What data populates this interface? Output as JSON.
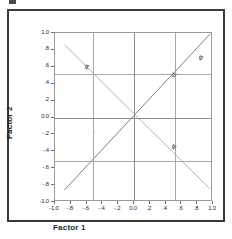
{
  "figure": {
    "x_axis_title": "Factor 1",
    "y_axis_title": "Factor 2"
  },
  "chart_data": {
    "type": "scatter",
    "title": "",
    "subtitle": "",
    "xlabel": "Factor 1",
    "ylabel": "Factor 2",
    "xlim": [
      -1.0,
      1.0
    ],
    "ylim": [
      -1.0,
      1.0
    ],
    "grid": true,
    "legend": "none",
    "xticks": [
      "-1.0",
      "-.8",
      "-.6",
      "-.4",
      "-.2",
      "0.0",
      ".2",
      ".4",
      ".6",
      ".8",
      "1.0"
    ],
    "xtick_values": [
      -1.0,
      -0.8,
      -0.6,
      -0.4,
      -0.2,
      0.0,
      0.2,
      0.4,
      0.6,
      0.8,
      1.0
    ],
    "yticks": [
      "1.0",
      ".8",
      ".6",
      ".4",
      ".2",
      "0.0",
      "-.2",
      "-.4",
      "-.6",
      "-.8",
      "-1.0"
    ],
    "ytick_values": [
      1.0,
      0.8,
      0.6,
      0.4,
      0.2,
      0.0,
      -0.2,
      -0.4,
      -0.6,
      -0.8,
      -1.0
    ],
    "points": [
      {
        "label": "x1",
        "x": 0.5,
        "y": 0.5
      },
      {
        "label": "x3",
        "x": 0.85,
        "y": 0.7
      },
      {
        "label": "x4",
        "x": -0.6,
        "y": 0.6
      },
      {
        "label": "x2",
        "x": 0.5,
        "y": -0.35
      }
    ],
    "lines": [
      {
        "name": "ascending-diagonal",
        "from": [
          -0.88,
          -0.88
        ],
        "to": [
          0.99,
          0.99
        ],
        "color": "#7d7d7d"
      },
      {
        "name": "descending-diagonal",
        "from": [
          -0.88,
          0.86
        ],
        "to": [
          0.98,
          -0.86
        ],
        "color": "#b0b0b0"
      }
    ]
  }
}
